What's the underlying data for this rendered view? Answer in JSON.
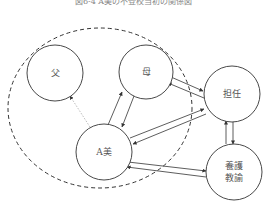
{
  "title": "図6-4 A美の不登校当初の関係図",
  "nodes": {
    "father": "父",
    "mother": "母",
    "ami": "A美",
    "teacher": "担任",
    "nurse_line1": "養護",
    "nurse_line2": "教諭"
  },
  "colors": {
    "stroke": "#333333",
    "dotted": "#aaaaaa",
    "text": "#555555"
  }
}
